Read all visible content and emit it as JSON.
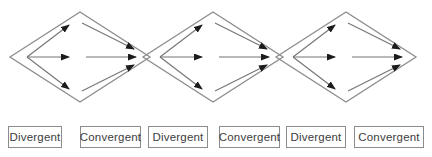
{
  "figure": {
    "colors": {
      "background": "#ffffff",
      "outline": "#8c8c8c",
      "arrow_line": "#757575",
      "arrowhead": "#1c1c1c",
      "box_border": "#8c8c8c",
      "label_text": "#3c3c3c"
    },
    "diamonds": [
      {
        "id": 1,
        "left_half": "Divergent",
        "right_half": "Convergent",
        "divergent_arrows": 3,
        "convergent_arrows": 3
      },
      {
        "id": 2,
        "left_half": "Divergent",
        "right_half": "Convergent",
        "divergent_arrows": 3,
        "convergent_arrows": 3
      },
      {
        "id": 3,
        "left_half": "Divergent",
        "right_half": "Convergent",
        "divergent_arrows": 3,
        "convergent_arrows": 3
      }
    ]
  },
  "labels": {
    "items": [
      {
        "label": "Divergent"
      },
      {
        "label": "Convergent"
      },
      {
        "label": "Divergent"
      },
      {
        "label": "Convergent"
      },
      {
        "label": "Divergent"
      },
      {
        "label": "Convergent"
      }
    ]
  }
}
